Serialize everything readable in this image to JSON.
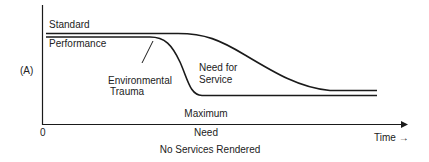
{
  "diagram": {
    "y_axis_label": "(A)",
    "origin_label": "0",
    "x_axis_label": "Time →",
    "curve_labels": {
      "standard": "Standard",
      "performance": "Performance",
      "environmental_trauma_line1": "Environmental",
      "environmental_trauma_line2": "Trauma",
      "need_for_service_line1": "Need for",
      "need_for_service_line2": "Service"
    },
    "max_need_line1": "Maximum",
    "max_need_line2": "Need",
    "bottom_caption": "No Services Rendered",
    "colors": {
      "line": "#1a1a1a",
      "background": "#ffffff"
    }
  }
}
